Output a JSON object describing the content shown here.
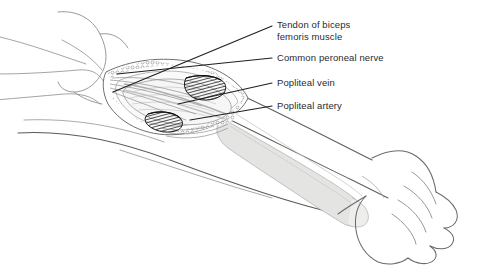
{
  "figure": {
    "type": "anatomical-line-drawing",
    "background_color": "#ffffff",
    "outline_color": "#3a3a3a",
    "faint_outline_color": "#9a9a9a",
    "bone_fill_color": "#e4e4e2",
    "hatch_color": "#1a1a1a",
    "leader_line_color": "#1f1f1f",
    "text_color": "#2b2b2b"
  },
  "labels": [
    {
      "id": "tendon",
      "line1": "Tendon of biceps",
      "line2": "femoris muscle",
      "target": "tendon-of-biceps-femoris-muscle"
    },
    {
      "id": "nerve",
      "line1": "Common peroneal nerve",
      "line2": "",
      "target": "common-peroneal-nerve"
    },
    {
      "id": "vein",
      "line1": "Popliteal vein",
      "line2": "",
      "target": "popliteal-vein"
    },
    {
      "id": "artery",
      "line1": "Popliteal artery",
      "line2": "",
      "target": "popliteal-artery"
    }
  ],
  "regions": [
    {
      "id": "thigh",
      "name": "thigh"
    },
    {
      "id": "popliteal-fossa",
      "name": "popliteal fossa"
    },
    {
      "id": "calf",
      "name": "calf"
    },
    {
      "id": "tibia",
      "name": "tibia"
    },
    {
      "id": "foot",
      "name": "foot"
    }
  ]
}
